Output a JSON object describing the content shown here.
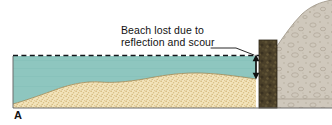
{
  "figure": {
    "panel_letter": "A",
    "type": "cross-section-diagram"
  },
  "annotations": {
    "callout": {
      "line1": "Beach lost due to",
      "line2": "reflection and scour",
      "leader_icon": "leader-line-icon",
      "target": "beach-loss-measure-arrow"
    },
    "measure_arrow": {
      "icon": "double-headed-arrow-icon",
      "orientation": "vertical",
      "meaning": "vertical extent of beach lost at the seawall"
    },
    "water_level": {
      "icon": "dashed-waterline-icon",
      "meaning": "still water level"
    }
  },
  "elements": {
    "water_label": "water",
    "sand_label": "beach sand",
    "seawall_label": "seawall",
    "bluff_label": "cobble bluff"
  },
  "colors": {
    "water": "#8ec6bf",
    "water_edge": "#6fb0a8",
    "sand": "#f2e3ba",
    "sand_stipple": "#c9ae6e",
    "sand_line": "#8e7d4e",
    "seawall": "#4b4029",
    "seawall_dark": "#332b19",
    "bluff": "#cfc8bc",
    "bluff_stipple": "#b0a896",
    "bluff_line": "#9a9283",
    "outline": "#5a5a5a",
    "ink": "#121212",
    "background": "#ffffff"
  }
}
